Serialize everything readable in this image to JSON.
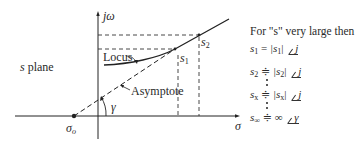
{
  "diagram": {
    "axes": {
      "vertical_label": "jω",
      "horizontal_label": "σ"
    },
    "plane_label": {
      "var": "s",
      "text": " plane"
    },
    "origin_point_label": {
      "main": "σ",
      "sub": "o"
    },
    "curve_labels": {
      "locus": "Locus",
      "asymptote": "Asymptote"
    },
    "angle_label": "γ",
    "points": [
      {
        "main": "s",
        "sub": "1"
      },
      {
        "main": "s",
        "sub": "2"
      }
    ],
    "colors": {
      "line": "#222222",
      "text": "#2a2a2a",
      "background": "#ffffff"
    }
  },
  "equations": {
    "heading": "For \"s\" very large then",
    "rows": [
      {
        "lhs": "s",
        "lhs_sub": "1",
        "op": "=",
        "mag": "|s",
        "mag_sub": "1",
        "mag_end": "|",
        "angle": "j"
      },
      {
        "lhs": "s",
        "lhs_sub": "2",
        "op": "≑",
        "mag": "|s",
        "mag_sub": "2",
        "mag_end": "|",
        "angle": "j"
      },
      {
        "lhs": "s",
        "lhs_sub": "x",
        "op": "≑",
        "mag": "|s",
        "mag_sub": "x",
        "mag_end": "|",
        "angle": "j"
      },
      {
        "lhs": "s",
        "lhs_sub": "∞",
        "op": "≑",
        "mag": "∞",
        "mag_sub": "",
        "mag_end": "",
        "angle": "γ"
      }
    ]
  }
}
